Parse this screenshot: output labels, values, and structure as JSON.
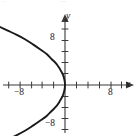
{
  "figure": {
    "name": "parabola-graph",
    "background_color": "#ffffff",
    "curve_color": "#1a1a1a",
    "axis_color": "#3a3a3a",
    "artifacts": {
      "top_left": "··",
      "top_center": "····"
    }
  },
  "axes": {
    "x_label": "x",
    "y_label": "y",
    "x_tick_labels": [
      "−8",
      "8"
    ],
    "y_tick_labels": [
      "8",
      "−8"
    ],
    "x_label_neg8": "−8",
    "x_label_pos8": "8",
    "y_label_pos8": "8",
    "y_label_neg8": "−8"
  },
  "chart_data": {
    "type": "line",
    "title": "",
    "subtitle": "",
    "xlabel": "x",
    "ylabel": "y",
    "xlim": [
      -12,
      12
    ],
    "ylim": [
      -12,
      12
    ],
    "xticks": [
      -10,
      -8,
      -6,
      -4,
      -2,
      0,
      2,
      4,
      6,
      8,
      10
    ],
    "yticks": [
      -10,
      -8,
      -6,
      -4,
      -2,
      0,
      2,
      4,
      6,
      8,
      10
    ],
    "xtick_labels": {
      "-8": "−8",
      "8": "8"
    },
    "ytick_labels": {
      "8": "8",
      "-8": "−8"
    },
    "grid": false,
    "legend": null,
    "axis_arrows": [
      "+x",
      "+y"
    ],
    "series": [
      {
        "name": "parabola",
        "equation": "x = -0.11 y^2",
        "opens": "left",
        "vertex": [
          0,
          0
        ],
        "points": [
          [
            -11.5,
            -10.2
          ],
          [
            -10.0,
            -9.5
          ],
          [
            -8.5,
            -8.8
          ],
          [
            -7.0,
            -8.0
          ],
          [
            -5.6,
            -7.1
          ],
          [
            -4.3,
            -6.2
          ],
          [
            -3.2,
            -5.4
          ],
          [
            -2.3,
            -4.5
          ],
          [
            -1.5,
            -3.7
          ],
          [
            -0.9,
            -2.8
          ],
          [
            -0.4,
            -1.9
          ],
          [
            -0.1,
            -0.9
          ],
          [
            0.0,
            0.0
          ],
          [
            -0.1,
            0.9
          ],
          [
            -0.4,
            1.9
          ],
          [
            -0.9,
            2.8
          ],
          [
            -1.5,
            3.7
          ],
          [
            -2.3,
            4.5
          ],
          [
            -3.2,
            5.4
          ],
          [
            -4.3,
            6.2
          ],
          [
            -5.6,
            7.1
          ],
          [
            -7.0,
            8.0
          ],
          [
            -8.5,
            8.8
          ],
          [
            -10.0,
            9.5
          ],
          [
            -11.5,
            10.2
          ]
        ]
      }
    ]
  }
}
